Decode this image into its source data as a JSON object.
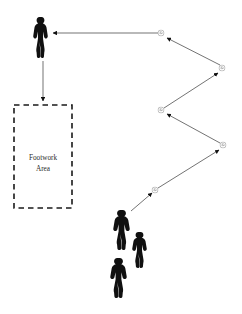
{
  "canvas": {
    "width": 242,
    "height": 314,
    "background": "#ffffff",
    "stroke_color": "#555555",
    "figure_color": "#101010",
    "dash_color": "#1a1a1a"
  },
  "zone": {
    "name": "footwork-area",
    "label_line1": "Footwork",
    "label_line2": "Area",
    "x": 14,
    "y": 105,
    "width": 58,
    "height": 103,
    "border_style": "dashed"
  },
  "players": [
    {
      "id": "player-receiver",
      "role": "receiver",
      "x": 33,
      "y": 17,
      "width": 15,
      "height": 41
    },
    {
      "id": "player-feeder-1",
      "role": "feeder",
      "x": 113,
      "y": 210,
      "width": 17,
      "height": 40
    },
    {
      "id": "player-feeder-2",
      "role": "feeder",
      "x": 132,
      "y": 232,
      "width": 15,
      "height": 36
    },
    {
      "id": "player-feeder-3",
      "role": "feeder",
      "x": 110,
      "y": 258,
      "width": 17,
      "height": 40
    }
  ],
  "shuttles": [
    {
      "id": "shuttle-1",
      "cx": 161,
      "cy": 33,
      "r": 3.6
    },
    {
      "id": "shuttle-2",
      "cx": 222,
      "cy": 68,
      "r": 3.6
    },
    {
      "id": "shuttle-3",
      "cx": 161,
      "cy": 110,
      "r": 3.6
    },
    {
      "id": "shuttle-4",
      "cx": 223,
      "cy": 145,
      "r": 3.6
    },
    {
      "id": "shuttle-5",
      "cx": 155,
      "cy": 190,
      "r": 3.6
    }
  ],
  "arrows": [
    {
      "id": "arrow-shuttle1-to-player",
      "from": "shuttle-1",
      "to": "player-receiver",
      "x1": 158,
      "y1": 33,
      "x2": 53,
      "y2": 33
    },
    {
      "id": "arrow-player-to-footwork-area",
      "from": "player-receiver",
      "to": "footwork-area",
      "x1": 43,
      "y1": 61,
      "x2": 43,
      "y2": 101
    },
    {
      "id": "arrow-shuttle2-to-shuttle1",
      "from": "shuttle-2",
      "to": "shuttle-1",
      "x1": 220,
      "y1": 65,
      "x2": 167,
      "y2": 38
    },
    {
      "id": "arrow-shuttle3-to-shuttle2",
      "from": "shuttle-3",
      "to": "shuttle-2",
      "x1": 164,
      "y1": 108,
      "x2": 218,
      "y2": 73
    },
    {
      "id": "arrow-shuttle4-to-shuttle3",
      "from": "shuttle-4",
      "to": "shuttle-3",
      "x1": 220,
      "y1": 143,
      "x2": 167,
      "y2": 114
    },
    {
      "id": "arrow-shuttle5-to-shuttle4",
      "from": "shuttle-5",
      "to": "shuttle-4",
      "x1": 158,
      "y1": 188,
      "x2": 219,
      "y2": 150
    },
    {
      "id": "arrow-feeder-to-shuttle5",
      "from": "player-feeder-1",
      "to": "shuttle-5",
      "x1": 131,
      "y1": 211,
      "x2": 152,
      "y2": 193
    }
  ]
}
